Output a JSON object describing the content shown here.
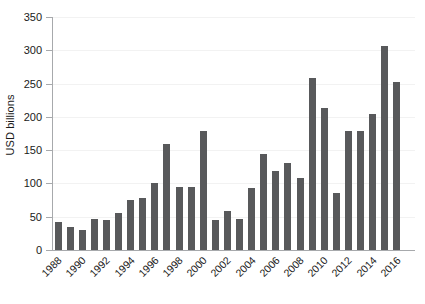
{
  "chart_data": {
    "type": "bar",
    "title": "",
    "xlabel": "",
    "ylabel": "USD billions",
    "ylim": [
      0,
      350
    ],
    "ytick_values": [
      0,
      50,
      100,
      150,
      200,
      250,
      300,
      350
    ],
    "ytick_labels": [
      "0",
      "50",
      "100",
      "150",
      "200",
      "250",
      "300",
      "350"
    ],
    "xtick_labels": [
      "1988",
      "1990",
      "1992",
      "1994",
      "1996",
      "1998",
      "2000",
      "2002",
      "2004",
      "2006",
      "2008",
      "2010",
      "2012",
      "2014",
      "2016"
    ],
    "grid": true,
    "legend": null,
    "bar_color": "#58595b",
    "axis_color": "#a7a9ac",
    "grid_color": "#f2f2f2",
    "categories": [
      "1988",
      "1989",
      "1990",
      "1991",
      "1992",
      "1993",
      "1994",
      "1995",
      "1996",
      "1997",
      "1998",
      "1999",
      "2000",
      "2001",
      "2002",
      "2003",
      "2004",
      "2005",
      "2006",
      "2007",
      "2008",
      "2009",
      "2010",
      "2011",
      "2012",
      "2013",
      "2014",
      "2015",
      "2016",
      "2017"
    ],
    "values": [
      42,
      35,
      30,
      47,
      45,
      55,
      75,
      78,
      100,
      159,
      94,
      94,
      179,
      45,
      59,
      46,
      93,
      144,
      118,
      130,
      108,
      258,
      213,
      86,
      179,
      179,
      205,
      307,
      253,
      0
    ],
    "series": [
      {
        "name": "USD billions",
        "values": [
          42,
          35,
          30,
          47,
          45,
          55,
          75,
          78,
          100,
          159,
          94,
          94,
          179,
          45,
          59,
          46,
          93,
          144,
          118,
          130,
          108,
          258,
          213,
          86,
          179,
          179,
          205,
          307,
          253,
          0
        ]
      }
    ]
  }
}
